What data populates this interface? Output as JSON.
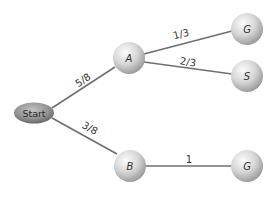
{
  "diagram": {
    "type": "probability-tree",
    "colors": {
      "node_light": "#f4f4f4",
      "node_dark": "#9a9a9a",
      "start_light": "#b8b8b8",
      "start_dark": "#6a6a6a",
      "edge": "#6f6f6f"
    },
    "nodes": {
      "start": {
        "label": "Start"
      },
      "a": {
        "label": "A"
      },
      "b": {
        "label": "B"
      },
      "a_g": {
        "label": "G"
      },
      "a_s": {
        "label": "S"
      },
      "b_g": {
        "label": "G"
      }
    },
    "edges": {
      "start_a": {
        "label": "5/8"
      },
      "start_b": {
        "label": "3/8"
      },
      "a_g": {
        "label": "1/3"
      },
      "a_s": {
        "label": "2/3"
      },
      "b_g": {
        "label": "1"
      }
    }
  }
}
